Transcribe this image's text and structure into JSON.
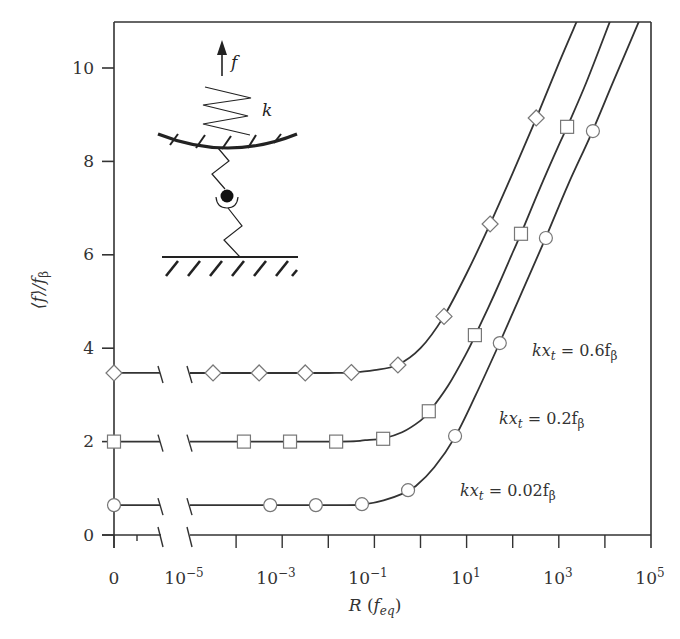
{
  "chart_data": {
    "type": "line",
    "title": "",
    "xlabel": "R (f_eq)",
    "xlabel_parts": {
      "main": "R",
      "paren_open": "(",
      "sub_main": "f",
      "sub": "eq",
      "paren_close": ")"
    },
    "ylabel": "⟨f⟩/f_β",
    "ylabel_parts": {
      "main": "⟨f⟩/f",
      "sub": "β"
    },
    "xscale": "log (with broken axis: R = 0 point, then 10^-5 to 10^5)",
    "xlim": [
      -5,
      5
    ],
    "ylim": [
      0,
      11
    ],
    "grid": false,
    "x_tick_labels": [
      {
        "label": "0",
        "base": "0",
        "exp": ""
      },
      {
        "label": "10^-5",
        "base": "10",
        "exp": "−5",
        "log": -5
      },
      {
        "label": "10^-3",
        "base": "10",
        "exp": "−3",
        "log": -3
      },
      {
        "label": "10^-1",
        "base": "10",
        "exp": "−1",
        "log": -1
      },
      {
        "label": "10^1",
        "base": "10",
        "exp": "1",
        "log": 1
      },
      {
        "label": "10^3",
        "base": "10",
        "exp": "3",
        "log": 3
      },
      {
        "label": "10^5",
        "base": "10",
        "exp": "5",
        "log": 5
      }
    ],
    "y_tick_labels": [
      "0",
      "2",
      "4",
      "6",
      "8",
      "10"
    ],
    "y_ticks": [
      0,
      2,
      4,
      6,
      8,
      10
    ],
    "series": [
      {
        "name": "kx_t = 0.6 f_β",
        "marker": "diamond",
        "label": {
          "pre": "kx",
          "sub1": "t",
          "mid": " = 0.6f",
          "sub2": "β"
        },
        "value_at_R0": 3.47,
        "points": [
          {
            "log10R": -4.5,
            "y": 3.47
          },
          {
            "log10R": -3.5,
            "y": 3.47
          },
          {
            "log10R": -2.5,
            "y": 3.47
          },
          {
            "log10R": -1.5,
            "y": 3.48
          },
          {
            "log10R": -0.49,
            "y": 3.64
          },
          {
            "log10R": 0.51,
            "y": 4.68
          },
          {
            "log10R": 1.51,
            "y": 6.66
          },
          {
            "log10R": 2.51,
            "y": 8.93
          }
        ],
        "curve": [
          [
            -5,
            3.47
          ],
          [
            -2,
            3.47
          ],
          [
            -1.5,
            3.48
          ],
          [
            -1,
            3.53
          ],
          [
            -0.5,
            3.64
          ],
          [
            0,
            4.0
          ],
          [
            0.5,
            4.67
          ],
          [
            1,
            5.6
          ],
          [
            1.5,
            6.64
          ],
          [
            2,
            7.75
          ],
          [
            2.5,
            8.9
          ],
          [
            3,
            10.1
          ],
          [
            3.39,
            11.0
          ]
        ]
      },
      {
        "name": "kx_t = 0.2 f_β",
        "marker": "square",
        "label": {
          "pre": "kx",
          "sub1": "t",
          "mid": " = 0.2f",
          "sub2": "β"
        },
        "value_at_R0": 2.0,
        "points": [
          {
            "log10R": -3.83,
            "y": 2.0
          },
          {
            "log10R": -2.83,
            "y": 2.0
          },
          {
            "log10R": -1.83,
            "y": 2.0
          },
          {
            "log10R": -0.81,
            "y": 2.06
          },
          {
            "log10R": 0.18,
            "y": 2.65
          },
          {
            "log10R": 1.18,
            "y": 4.28
          },
          {
            "log10R": 2.18,
            "y": 6.45
          },
          {
            "log10R": 3.18,
            "y": 8.74
          }
        ],
        "curve": [
          [
            -5,
            2.0
          ],
          [
            -1.8,
            2.0
          ],
          [
            -1.2,
            2.03
          ],
          [
            -0.8,
            2.07
          ],
          [
            -0.4,
            2.2
          ],
          [
            0,
            2.45
          ],
          [
            0.2,
            2.65
          ],
          [
            0.6,
            3.2
          ],
          [
            1,
            3.9
          ],
          [
            1.2,
            4.3
          ],
          [
            1.6,
            5.15
          ],
          [
            2,
            6.05
          ],
          [
            2.2,
            6.5
          ],
          [
            2.6,
            7.45
          ],
          [
            3,
            8.35
          ],
          [
            3.2,
            8.78
          ],
          [
            3.6,
            9.7
          ],
          [
            4.11,
            11.0
          ]
        ]
      },
      {
        "name": "kx_t = 0.02 f_β",
        "marker": "circle",
        "label": {
          "pre": "kx",
          "sub1": "t",
          "mid": " = 0.02f",
          "sub2": "β"
        },
        "value_at_R0": 0.64,
        "points": [
          {
            "log10R": -3.26,
            "y": 0.64
          },
          {
            "log10R": -2.27,
            "y": 0.64
          },
          {
            "log10R": -1.27,
            "y": 0.66
          },
          {
            "log10R": -0.27,
            "y": 0.96
          },
          {
            "log10R": 0.75,
            "y": 2.12
          },
          {
            "log10R": 1.72,
            "y": 4.11
          },
          {
            "log10R": 2.72,
            "y": 6.36
          },
          {
            "log10R": 3.74,
            "y": 8.65
          }
        ],
        "curve": [
          [
            -5,
            0.64
          ],
          [
            -1.6,
            0.64
          ],
          [
            -1.2,
            0.66
          ],
          [
            -0.8,
            0.74
          ],
          [
            -0.4,
            0.88
          ],
          [
            -0.1,
            1.05
          ],
          [
            0.3,
            1.45
          ],
          [
            0.75,
            2.1
          ],
          [
            1.2,
            3.0
          ],
          [
            1.7,
            4.08
          ],
          [
            2.2,
            5.2
          ],
          [
            2.7,
            6.33
          ],
          [
            3.2,
            7.5
          ],
          [
            3.7,
            8.58
          ],
          [
            4.2,
            9.75
          ],
          [
            4.74,
            11.0
          ]
        ]
      }
    ]
  },
  "inset": {
    "force_label": "f",
    "spring_label": "k"
  }
}
